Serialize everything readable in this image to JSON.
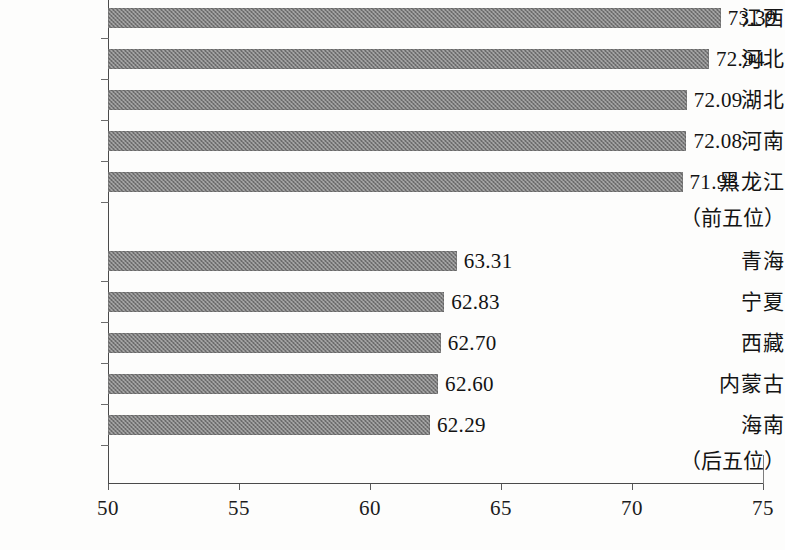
{
  "chart_data": {
    "type": "bar",
    "orientation": "horizontal",
    "title": "",
    "xlabel": "",
    "ylabel": "",
    "xlim": [
      50,
      75
    ],
    "xticks": [
      50,
      55,
      60,
      65,
      70,
      75
    ],
    "xtick_labels": [
      "50",
      "55",
      "60",
      "65",
      "70",
      "75"
    ],
    "grid": false,
    "legend": null,
    "bar_color": "#7c7c7c",
    "categories": [
      "江西",
      "河北",
      "湖北",
      "河南",
      "黑龙江",
      "青海",
      "宁夏",
      "西藏",
      "内蒙古",
      "海南"
    ],
    "values": [
      73.39,
      72.94,
      72.09,
      72.08,
      71.93,
      63.31,
      62.83,
      62.7,
      62.6,
      62.29
    ],
    "value_labels": [
      "73.39",
      "72.94",
      "72.09",
      "72.08",
      "71.93",
      "63.31",
      "62.83",
      "62.70",
      "62.60",
      "62.29"
    ],
    "annotations": [
      {
        "text": "（前五位）",
        "after_category": "黑龙江"
      },
      {
        "text": "（后五位）",
        "after_category": "海南"
      }
    ]
  },
  "bars": [
    {
      "label": "江西",
      "value": 73.39,
      "value_text": "73.39"
    },
    {
      "label": "河北",
      "value": 72.94,
      "value_text": "72.94"
    },
    {
      "label": "湖北",
      "value": 72.09,
      "value_text": "72.09"
    },
    {
      "label": "河南",
      "value": 72.08,
      "value_text": "72.08"
    },
    {
      "label": "黑龙江",
      "value": 71.93,
      "value_text": "71.93"
    },
    {
      "label": "青海",
      "value": 63.31,
      "value_text": "63.31"
    },
    {
      "label": "宁夏",
      "value": 62.83,
      "value_text": "62.83"
    },
    {
      "label": "西藏",
      "value": 62.7,
      "value_text": "62.70"
    },
    {
      "label": "内蒙古",
      "value": 62.6,
      "value_text": "62.60"
    },
    {
      "label": "海南",
      "value": 62.29,
      "value_text": "62.29"
    }
  ],
  "notes": {
    "top_group": "（前五位）",
    "bottom_group": "（后五位）"
  },
  "axis": {
    "ticks": [
      "50",
      "55",
      "60",
      "65",
      "70",
      "75"
    ]
  }
}
